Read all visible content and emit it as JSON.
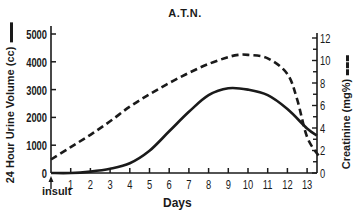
{
  "chart_data": {
    "type": "line",
    "title": "A.T.N.",
    "xlabel": "Days",
    "x_annotation": "insult",
    "xlim": [
      0,
      13.7
    ],
    "x_ticks": [
      0,
      1,
      2,
      3,
      4,
      5,
      6,
      7,
      8,
      9,
      10,
      11,
      12,
      13
    ],
    "x_tick_labels": [
      "1",
      "2",
      "3",
      "4",
      "5",
      "6",
      "7",
      "8",
      "9",
      "10",
      "11",
      "12",
      "13"
    ],
    "ylabel_left": "24 Hour Urine Volume (cc)",
    "ylim_left": [
      0,
      5000
    ],
    "y_ticks_left": [
      0,
      1000,
      2000,
      3000,
      4000,
      5000
    ],
    "ylabel_right": "Creatinine (mg%)",
    "ylim_right": [
      0,
      12
    ],
    "y_ticks_right": [
      0,
      1,
      2,
      3,
      4,
      5,
      6,
      7,
      8,
      9,
      10,
      11,
      12
    ],
    "y_tick_labels_right": [
      "0",
      "2",
      "4",
      "6",
      "8",
      "10",
      "12"
    ],
    "grid": false,
    "series": [
      {
        "name": "24 Hour Urine Volume (cc)",
        "axis": "left",
        "style": "solid",
        "x": [
          0,
          1,
          2,
          3,
          4,
          5,
          6,
          7,
          8,
          9,
          10,
          11,
          12,
          13,
          13.5
        ],
        "values": [
          0,
          0,
          50,
          150,
          350,
          800,
          1500,
          2200,
          2800,
          3050,
          3000,
          2800,
          2300,
          1600,
          1350
        ]
      },
      {
        "name": "Creatinine (mg%)",
        "axis": "right",
        "style": "dashed",
        "x": [
          0,
          1,
          2,
          3,
          4,
          5,
          6,
          7,
          8,
          9,
          9.5,
          10,
          11,
          12,
          12.5,
          13,
          13.6
        ],
        "values": [
          1.2,
          2.3,
          3.4,
          4.6,
          5.9,
          7.0,
          8.0,
          8.9,
          9.7,
          10.3,
          10.5,
          10.5,
          10.2,
          8.8,
          6.5,
          3.2,
          1.5
        ]
      }
    ]
  },
  "labels": {
    "title": "A.T.N.",
    "xlabel": "Days",
    "insult": "insult",
    "ylabel_left": "24 Hour Urine Volume (cc)",
    "ylabel_right": "Creatinine (mg%)"
  },
  "colors": {
    "ink": "#1a1a1a",
    "background": "#ffffff"
  }
}
